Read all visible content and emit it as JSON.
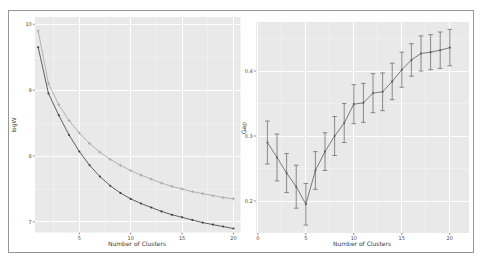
{
  "figure": {
    "background": "#ffffff",
    "border_color": "#969696"
  },
  "chart_data": [
    {
      "type": "line",
      "title": "",
      "xlabel": "Number of Clusters",
      "ylabel": "logW",
      "x": [
        1,
        2,
        3,
        4,
        5,
        6,
        7,
        8,
        9,
        10,
        11,
        12,
        13,
        14,
        15,
        16,
        17,
        18,
        19,
        20
      ],
      "series": [
        {
          "name": "expected E.logW (light gray curve, plus markers)",
          "color": "#a2a2a2",
          "marker": "plus",
          "values": [
            9.9,
            9.1,
            8.78,
            8.54,
            8.35,
            8.19,
            8.06,
            7.95,
            7.86,
            7.78,
            7.71,
            7.65,
            7.59,
            7.54,
            7.5,
            7.46,
            7.43,
            7.4,
            7.37,
            7.35
          ]
        },
        {
          "name": "observed logW (dark curve, dot markers)",
          "color": "#3a3a3a",
          "marker": "dot",
          "values": [
            9.65,
            8.95,
            8.62,
            8.32,
            8.07,
            7.86,
            7.69,
            7.55,
            7.44,
            7.35,
            7.28,
            7.22,
            7.16,
            7.11,
            7.07,
            7.03,
            6.99,
            6.96,
            6.93,
            6.9
          ]
        }
      ],
      "xlim": [
        0.69,
        20.68
      ],
      "ylim": [
        6.84,
        10.11
      ],
      "xticks": [
        {
          "v": 5,
          "label": "5"
        },
        {
          "v": 10,
          "label": "10"
        },
        {
          "v": 15,
          "label": "15"
        },
        {
          "v": 20,
          "label": "20"
        }
      ],
      "yticks": [
        {
          "v": 7,
          "label": "7"
        },
        {
          "v": 8,
          "label": "8"
        },
        {
          "v": 9,
          "label": "9"
        },
        {
          "v": 10,
          "label": "10"
        }
      ],
      "xminor": [
        2.5,
        7.5,
        12.5,
        17.5
      ],
      "yminor": [
        7.5,
        8.5,
        9.5
      ],
      "grid": true,
      "legend_position": "none",
      "panel_bg": "#e9e9e9",
      "grid_color": "#ffffff"
    },
    {
      "type": "line",
      "title": "",
      "xlabel": "Number of Clusters",
      "ylabel": "Gap",
      "x": [
        1,
        2,
        3,
        4,
        5,
        6,
        7,
        8,
        9,
        10,
        11,
        12,
        13,
        14,
        15,
        16,
        17,
        18,
        19,
        20
      ],
      "series": [
        {
          "name": "Gap statistic with standard-error bars",
          "color": "#5c5c5c",
          "marker": "dot",
          "values": [
            0.29,
            0.267,
            0.243,
            0.222,
            0.195,
            0.247,
            0.276,
            0.3,
            0.32,
            0.349,
            0.351,
            0.366,
            0.368,
            0.384,
            0.402,
            0.417,
            0.427,
            0.429,
            0.432,
            0.436
          ],
          "error": [
            0.033,
            0.036,
            0.03,
            0.033,
            0.032,
            0.029,
            0.029,
            0.03,
            0.03,
            0.03,
            0.03,
            0.03,
            0.029,
            0.028,
            0.027,
            0.025,
            0.027,
            0.027,
            0.028,
            0.028
          ]
        }
      ],
      "xlim": [
        -0.19,
        22.0
      ],
      "ylim": [
        0.1508,
        0.4754
      ],
      "xticks": [
        {
          "v": 0,
          "label": "0"
        },
        {
          "v": 5,
          "label": "5"
        },
        {
          "v": 10,
          "label": "10"
        },
        {
          "v": 15,
          "label": "15"
        },
        {
          "v": 20,
          "label": "20"
        }
      ],
      "yticks": [
        {
          "v": 0.2,
          "label": "0.2"
        },
        {
          "v": 0.3,
          "label": "0.3"
        },
        {
          "v": 0.4,
          "label": "0.4"
        }
      ],
      "xminor": [
        2.5,
        7.5,
        12.5,
        17.5
      ],
      "yminor": [
        0.15,
        0.25,
        0.35,
        0.45
      ],
      "grid": true,
      "legend_position": "none",
      "panel_bg": "#e9e9e9",
      "grid_color": "#ffffff"
    }
  ]
}
